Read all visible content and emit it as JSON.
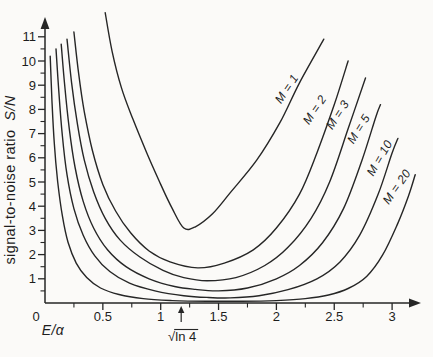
{
  "figure": {
    "background": "#fbfaf8",
    "ink_color": "#262626",
    "width": 433,
    "height": 357
  },
  "chart_data": {
    "type": "line",
    "title": "",
    "xlabel": "E/α",
    "ylabel": "signal-to-noise ratio S/N",
    "ylabel_plain": "signal-to-noise ratio",
    "ylabel_math": "S/N",
    "xlim": [
      0,
      3.25
    ],
    "ylim": [
      0,
      12.3
    ],
    "grid": false,
    "legend_position": "labels drawn along curves",
    "x_axis": {
      "origin_label": "0",
      "major_ticks": [
        0.5,
        1,
        1.5,
        2,
        2.5,
        3
      ],
      "major_labels": [
        "0.5",
        "1",
        "1.5",
        "2",
        "2.5",
        "3"
      ],
      "minor_ticks": [
        0.25,
        0.75,
        1.25,
        1.75,
        2.25,
        2.75
      ]
    },
    "y_axis": {
      "major_ticks": [
        1,
        2,
        3,
        4,
        5,
        6,
        7,
        8,
        9,
        10,
        11
      ],
      "major_labels": [
        "1",
        "2",
        "3",
        "4",
        "5",
        "6",
        "7",
        "8",
        "9",
        "10",
        "11"
      ],
      "minor_step": 0.5
    },
    "annotation": {
      "label": "√ln 4",
      "radical": "√",
      "radicand": "ln 4",
      "x": 1.177,
      "arrow": "↑"
    },
    "series": [
      {
        "name": "M=1",
        "label": "M = 1",
        "label_px": [
          290,
          91
        ],
        "label_angle": -56,
        "minimum": {
          "x": 1.2,
          "y": 3.0
        },
        "points": [
          [
            0.52,
            12.0
          ],
          [
            0.58,
            10.4
          ],
          [
            0.66,
            8.9
          ],
          [
            0.76,
            7.6
          ],
          [
            0.88,
            6.2
          ],
          [
            1.0,
            4.9
          ],
          [
            1.1,
            3.9
          ],
          [
            1.2,
            3.1
          ],
          [
            1.3,
            3.15
          ],
          [
            1.45,
            3.7
          ],
          [
            1.6,
            4.55
          ],
          [
            1.83,
            5.9
          ],
          [
            2.03,
            7.45
          ],
          [
            2.2,
            9.1
          ],
          [
            2.41,
            10.9
          ]
        ]
      },
      {
        "name": "M=2",
        "label": "M = 2",
        "label_px": [
          318,
          112
        ],
        "label_angle": -56,
        "minimum": {
          "x": 1.32,
          "y": 1.45
        },
        "points": [
          [
            0.25,
            11.2
          ],
          [
            0.29,
            9.5
          ],
          [
            0.34,
            7.9
          ],
          [
            0.41,
            6.3
          ],
          [
            0.5,
            4.9
          ],
          [
            0.61,
            3.8
          ],
          [
            0.74,
            2.9
          ],
          [
            0.9,
            2.15
          ],
          [
            1.08,
            1.7
          ],
          [
            1.32,
            1.45
          ],
          [
            1.55,
            1.65
          ],
          [
            1.8,
            2.2
          ],
          [
            2.0,
            3.1
          ],
          [
            2.2,
            4.5
          ],
          [
            2.35,
            6.2
          ],
          [
            2.5,
            8.2
          ],
          [
            2.62,
            10.0
          ]
        ]
      },
      {
        "name": "M=3",
        "label": "M = 3",
        "label_px": [
          341,
          117
        ],
        "label_angle": -57,
        "minimum": {
          "x": 1.4,
          "y": 0.92
        },
        "points": [
          [
            0.19,
            10.9
          ],
          [
            0.23,
            9.1
          ],
          [
            0.28,
            7.4
          ],
          [
            0.34,
            5.9
          ],
          [
            0.42,
            4.6
          ],
          [
            0.52,
            3.5
          ],
          [
            0.65,
            2.6
          ],
          [
            0.82,
            1.9
          ],
          [
            1.02,
            1.35
          ],
          [
            1.2,
            1.05
          ],
          [
            1.4,
            0.92
          ],
          [
            1.65,
            1.05
          ],
          [
            1.9,
            1.55
          ],
          [
            2.1,
            2.3
          ],
          [
            2.3,
            3.5
          ],
          [
            2.46,
            5.0
          ],
          [
            2.62,
            7.2
          ],
          [
            2.77,
            9.3
          ]
        ]
      },
      {
        "name": "M=5",
        "label": "M = 5",
        "label_px": [
          362,
          131
        ],
        "label_angle": -58,
        "minimum": {
          "x": 1.5,
          "y": 0.5
        },
        "points": [
          [
            0.14,
            10.7
          ],
          [
            0.17,
            9.0
          ],
          [
            0.21,
            7.2
          ],
          [
            0.26,
            5.6
          ],
          [
            0.33,
            4.2
          ],
          [
            0.42,
            3.1
          ],
          [
            0.54,
            2.2
          ],
          [
            0.7,
            1.5
          ],
          [
            0.9,
            1.0
          ],
          [
            1.12,
            0.68
          ],
          [
            1.3,
            0.56
          ],
          [
            1.5,
            0.5
          ],
          [
            1.75,
            0.62
          ],
          [
            2.0,
            1.0
          ],
          [
            2.2,
            1.55
          ],
          [
            2.4,
            2.5
          ],
          [
            2.58,
            3.9
          ],
          [
            2.74,
            5.9
          ],
          [
            2.86,
            7.7
          ],
          [
            2.9,
            8.2
          ]
        ]
      },
      {
        "name": "M=10",
        "label": "M = 10",
        "label_px": [
          383,
          160
        ],
        "label_angle": -60,
        "minimum": {
          "x": 1.6,
          "y": 0.21
        },
        "points": [
          [
            0.095,
            10.5
          ],
          [
            0.12,
            8.7
          ],
          [
            0.15,
            6.9
          ],
          [
            0.19,
            5.3
          ],
          [
            0.25,
            3.9
          ],
          [
            0.33,
            2.8
          ],
          [
            0.43,
            1.95
          ],
          [
            0.56,
            1.3
          ],
          [
            0.73,
            0.82
          ],
          [
            0.95,
            0.5
          ],
          [
            1.2,
            0.3
          ],
          [
            1.4,
            0.23
          ],
          [
            1.6,
            0.21
          ],
          [
            1.85,
            0.3
          ],
          [
            2.1,
            0.55
          ],
          [
            2.35,
            1.0
          ],
          [
            2.55,
            1.7
          ],
          [
            2.72,
            2.8
          ],
          [
            2.88,
            4.5
          ],
          [
            3.0,
            6.2
          ],
          [
            3.05,
            6.8
          ]
        ]
      },
      {
        "name": "M=20",
        "label": "M = 20",
        "label_px": [
          400,
          189
        ],
        "label_angle": -55,
        "minimum": {
          "x": 1.7,
          "y": 0.07
        },
        "points": [
          [
            0.045,
            10.2
          ],
          [
            0.06,
            8.4
          ],
          [
            0.08,
            6.6
          ],
          [
            0.11,
            5.0
          ],
          [
            0.15,
            3.6
          ],
          [
            0.2,
            2.5
          ],
          [
            0.27,
            1.65
          ],
          [
            0.36,
            1.05
          ],
          [
            0.48,
            0.62
          ],
          [
            0.64,
            0.35
          ],
          [
            0.85,
            0.18
          ],
          [
            1.1,
            0.1
          ],
          [
            1.4,
            0.07
          ],
          [
            1.7,
            0.07
          ],
          [
            2.0,
            0.1
          ],
          [
            2.25,
            0.18
          ],
          [
            2.45,
            0.33
          ],
          [
            2.62,
            0.6
          ],
          [
            2.78,
            1.1
          ],
          [
            2.92,
            2.0
          ],
          [
            3.05,
            3.3
          ],
          [
            3.14,
            4.4
          ],
          [
            3.2,
            5.3
          ]
        ]
      }
    ]
  }
}
